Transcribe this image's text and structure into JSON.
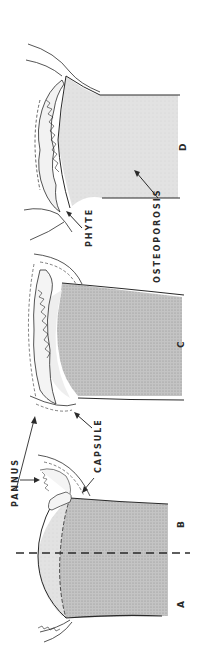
{
  "figure": {
    "orientation": "rotated 90 degrees counter-clockwise",
    "panels": [
      {
        "id": "A",
        "label": "A"
      },
      {
        "id": "B",
        "label": "B"
      },
      {
        "id": "C",
        "label": "C"
      },
      {
        "id": "D",
        "label": "D"
      }
    ],
    "annotations": {
      "pannus": "PANNUS",
      "capsule": "CAPSULE",
      "phyte": "PHYTE",
      "osteoporosis": "OSTEOPOROSIS"
    },
    "colors": {
      "bone_shaded": "#b8b8b8",
      "bone_light": "#dedede",
      "cartilage": "#eeeeee",
      "line": "#2a2a2a",
      "background": "#ffffff"
    }
  }
}
